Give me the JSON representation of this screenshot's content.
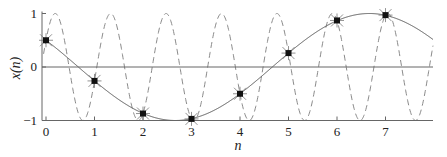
{
  "chart_data": {
    "type": "line",
    "title": "",
    "xlabel": "n",
    "ylabel": "x(n)",
    "xlim": [
      -0.08,
      8
    ],
    "ylim": [
      -1,
      1
    ],
    "xticks": [
      0,
      1,
      2,
      3,
      4,
      5,
      6,
      7
    ],
    "xtick_labels": [
      "0",
      "1",
      "2",
      "3",
      "4",
      "5",
      "6",
      "7"
    ],
    "yticks": [
      -1,
      0,
      1
    ],
    "ytick_labels": [
      "−1",
      "0",
      "1"
    ],
    "grid": false,
    "legend": null,
    "series": [
      {
        "name": "continuous low-frequency sinusoid",
        "style": "solid",
        "color": "#555555",
        "formula": "cos(pi*n/4 + pi/3)",
        "frequency": 0.125
      },
      {
        "name": "continuous high-frequency alias sinusoid",
        "style": "dashed",
        "color": "#888888",
        "formula": "cos(2*pi*0.875*n - pi/3)",
        "frequency": 0.875
      },
      {
        "name": "samples",
        "style": "markers",
        "marker": "star-square",
        "color": "#111111",
        "x": [
          0,
          1,
          2,
          3,
          4,
          5,
          6,
          7
        ],
        "y": [
          0.5,
          -0.26,
          -0.87,
          -0.97,
          -0.5,
          0.26,
          0.87,
          0.97
        ]
      }
    ]
  },
  "colors": {
    "axis": "#666666",
    "solid_curve": "#555555",
    "dashed_curve": "#8a8a8a",
    "marker": "#111111"
  }
}
